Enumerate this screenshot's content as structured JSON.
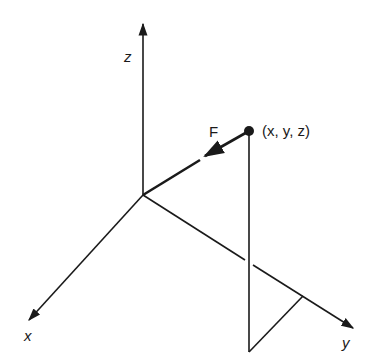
{
  "diagram": {
    "type": "3d-coordinate-force-diagram",
    "colors": {
      "ink": "#1a1a1a",
      "background": "#ffffff"
    },
    "axes": {
      "x": {
        "label": "x"
      },
      "y": {
        "label": "y"
      },
      "z": {
        "label": "z"
      }
    },
    "point": {
      "label": "(x, y, z)"
    },
    "force": {
      "label": "F"
    }
  }
}
